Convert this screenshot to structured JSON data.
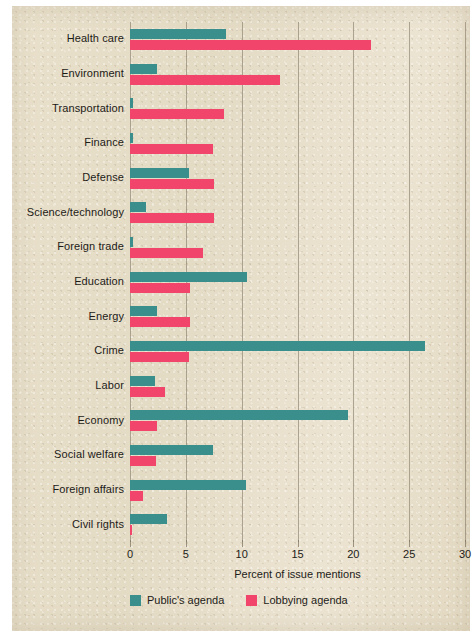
{
  "chart_data": {
    "type": "bar",
    "orientation": "horizontal",
    "title": "",
    "xlabel": "Percent of issue mentions",
    "ylabel": "",
    "xlim": [
      0,
      30
    ],
    "xticks": [
      0,
      5,
      10,
      15,
      20,
      25,
      30
    ],
    "grid": true,
    "legend_position": "bottom-left",
    "categories": [
      "Health care",
      "Environment",
      "Transportation",
      "Finance",
      "Defense",
      "Science/technology",
      "Foreign trade",
      "Education",
      "Energy",
      "Crime",
      "Labor",
      "Economy",
      "Social welfare",
      "Foreign affairs",
      "Civil  rights"
    ],
    "series": [
      {
        "name": "Public's agenda",
        "color": "#3a8e8c",
        "values": [
          8.6,
          2.4,
          0.3,
          0.3,
          5.3,
          1.4,
          0.3,
          10.5,
          2.4,
          26.4,
          2.2,
          19.5,
          7.4,
          10.4,
          3.3
        ]
      },
      {
        "name": "Lobbying agenda",
        "color": "#f2456c",
        "values": [
          21.6,
          13.4,
          8.4,
          7.4,
          7.5,
          7.5,
          6.5,
          5.4,
          5.4,
          5.3,
          3.1,
          2.4,
          2.3,
          1.2,
          0.2
        ]
      }
    ]
  }
}
